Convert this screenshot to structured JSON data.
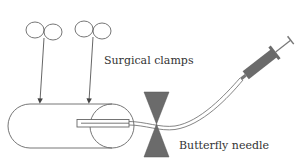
{
  "diagram": {
    "labels": {
      "clamps": "Surgical clamps",
      "needle": "Butterfly needle"
    },
    "components": [
      {
        "id": "surgical-clamp-1",
        "type": "clamp"
      },
      {
        "id": "surgical-clamp-2",
        "type": "clamp"
      },
      {
        "id": "blood-vessel",
        "type": "tube"
      },
      {
        "id": "butterfly-needle",
        "type": "needle"
      },
      {
        "id": "tubing",
        "type": "line"
      },
      {
        "id": "syringe",
        "type": "syringe"
      }
    ],
    "colors": {
      "line": "#555555",
      "fill_dark": "#6b6b6b",
      "background": "#ffffff"
    }
  }
}
